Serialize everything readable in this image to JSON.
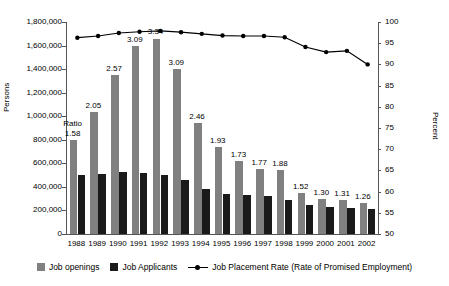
{
  "chart_data": {
    "type": "bar",
    "title": "",
    "xlabel": "",
    "ylabel": "Persons",
    "y2label": "Percent",
    "categories": [
      "1988",
      "1989",
      "1990",
      "1991",
      "1992",
      "1993",
      "1994",
      "1995",
      "1996",
      "1997",
      "1998",
      "1999",
      "2000",
      "2001",
      "2002"
    ],
    "ylim": [
      0,
      1800000
    ],
    "yticks": [
      "0",
      "200,000",
      "400,000",
      "600,000",
      "800,000",
      "1,000,000",
      "1,200,000",
      "1,400,000",
      "1,600,000",
      "1,800,000"
    ],
    "y2lim": [
      50,
      100
    ],
    "y2ticks": [
      "50",
      "55",
      "60",
      "65",
      "70",
      "75",
      "80",
      "85",
      "90",
      "95",
      "100"
    ],
    "grid": false,
    "legend_position": "bottom",
    "series": [
      {
        "name": "Job openings",
        "type": "bar",
        "axis": "left",
        "color": "#808080",
        "values": [
          800000,
          1040000,
          1350000,
          1600000,
          1660000,
          1400000,
          945000,
          735000,
          620000,
          550000,
          545000,
          350000,
          300000,
          290000,
          265000
        ]
      },
      {
        "name": "Job Applicants",
        "type": "bar",
        "axis": "left",
        "color": "#1a1a1a",
        "values": [
          505000,
          510000,
          525000,
          520000,
          500000,
          455000,
          385000,
          340000,
          330000,
          320000,
          290000,
          245000,
          230000,
          225000,
          215000
        ]
      },
      {
        "name": "Job Placement Rate (Rate of Promised Employment)",
        "type": "line",
        "axis": "right",
        "color": "#000000",
        "values": [
          96.3,
          96.7,
          97.4,
          97.7,
          97.9,
          97.6,
          97.2,
          96.8,
          96.7,
          96.7,
          96.4,
          94.1,
          92.9,
          93.2,
          90.0
        ]
      }
    ],
    "data_labels": {
      "name": "Ratio",
      "prefix_label": "Ratio",
      "values": [
        "1.58",
        "2.05",
        "2.57",
        "3.09",
        "3.34",
        "3.09",
        "2.46",
        "1.93",
        "1.73",
        "1.77",
        "1.88",
        "1.52",
        "1.30",
        "1.31",
        "1.26"
      ]
    }
  },
  "legend": {
    "items": [
      {
        "label": "Job openings",
        "marker": "gray-square-swatch"
      },
      {
        "label": "Job Applicants",
        "marker": "black-square-swatch"
      },
      {
        "label": "Job Placement Rate (Rate of Promised Employment)",
        "marker": "line-marker-swatch"
      }
    ]
  }
}
